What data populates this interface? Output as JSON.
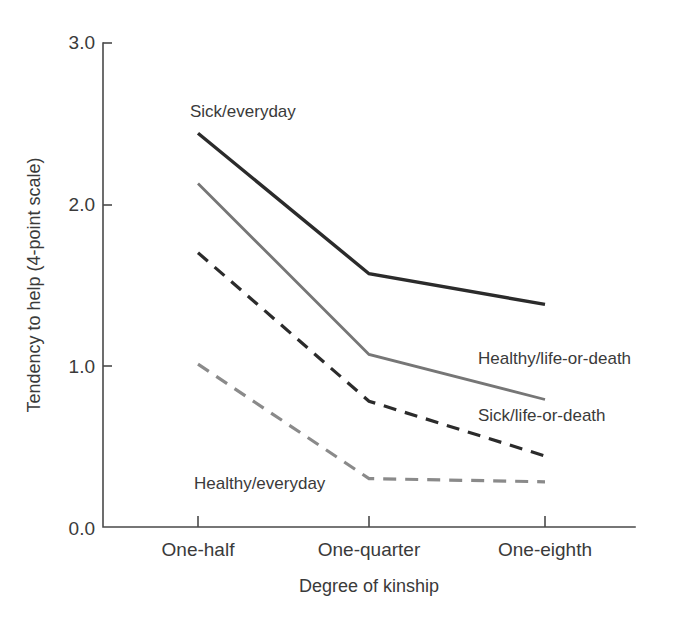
{
  "chart_data": {
    "type": "line",
    "title": "",
    "xlabel": "Degree of kinship",
    "ylabel": "Tendency to help (4-point scale)",
    "categories": [
      "One-half",
      "One-quarter",
      "One-eighth"
    ],
    "ylim": [
      0.0,
      3.0
    ],
    "yticks": [
      "0.0",
      "1.0",
      "2.0",
      "3.0"
    ],
    "ytick_values": [
      0.0,
      1.0,
      2.0,
      3.0
    ],
    "grid": false,
    "legend": "inline-labels",
    "series": [
      {
        "name": "Sick/everyday",
        "values": [
          2.44,
          1.57,
          1.38
        ],
        "color": "#2b2b2b",
        "style": "solid",
        "width": 3.4,
        "label_x": 190,
        "label_y": 117
      },
      {
        "name": "Healthy/life-or-death",
        "values": [
          2.13,
          1.07,
          0.79
        ],
        "color": "#767676",
        "style": "solid",
        "width": 2.8,
        "label_x": 478,
        "label_y": 364
      },
      {
        "name": "Sick/life-or-death",
        "values": [
          1.7,
          0.78,
          0.44
        ],
        "color": "#2b2b2b",
        "style": "dashed",
        "width": 3.2,
        "label_x": 478,
        "label_y": 421
      },
      {
        "name": "Healthy/everyday",
        "values": [
          1.01,
          0.3,
          0.28
        ],
        "color": "#8a8a8a",
        "style": "dashed",
        "width": 3.2,
        "label_x": 194,
        "label_y": 489
      }
    ]
  },
  "axes": {
    "y_tick_labels": [
      "3.0",
      "2.0",
      "1.0",
      "0.0"
    ],
    "x_tick_labels": [
      "One-half",
      "One-quarter",
      "One-eighth"
    ],
    "y_axis_title": "Tendency to help (4-point scale)",
    "x_axis_title": "Degree of kinship"
  },
  "colors": {
    "axis": "#4a4a4a",
    "text": "#3a3a3a",
    "dark_series": "#2b2b2b",
    "mid_gray_series": "#767676",
    "light_gray_series": "#8a8a8a",
    "background": "#ffffff"
  }
}
